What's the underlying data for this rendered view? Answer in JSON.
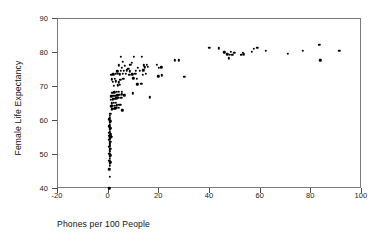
{
  "chart_data": {
    "type": "scatter",
    "title": "",
    "xlabel": "Phones per 100 People",
    "ylabel": "Female Life Expectancy",
    "xlim": [
      -20,
      100
    ],
    "ylim": [
      40,
      90
    ],
    "xticks": [
      -20,
      0,
      20,
      40,
      60,
      80,
      100
    ],
    "yticks": [
      40,
      50,
      60,
      70,
      80,
      90
    ],
    "xtick_labels": [
      "-20",
      "0",
      "20",
      "40",
      "60",
      "80",
      "100"
    ],
    "ytick_labels": [
      "40",
      "50",
      "60",
      "70",
      "80",
      "90"
    ],
    "grid": false,
    "legend": false,
    "marker": {
      "shape": "circle",
      "color": "#000000",
      "size": 2.4
    },
    "points": [
      [
        0.3,
        40.2
      ],
      [
        0.4,
        43.5
      ],
      [
        0.3,
        45.8
      ],
      [
        0.5,
        46.9
      ],
      [
        0.4,
        47.4
      ],
      [
        0.6,
        47.8
      ],
      [
        0.3,
        48.3
      ],
      [
        0.5,
        48.8
      ],
      [
        0.4,
        49.4
      ],
      [
        0.6,
        49.9
      ],
      [
        0.3,
        50.4
      ],
      [
        0.5,
        50.9
      ],
      [
        0.4,
        51.4
      ],
      [
        0.6,
        51.9
      ],
      [
        0.3,
        52.4
      ],
      [
        0.5,
        52.9
      ],
      [
        0.4,
        53.4
      ],
      [
        0.6,
        53.9
      ],
      [
        0.3,
        54.4
      ],
      [
        0.5,
        54.8
      ],
      [
        0.4,
        55.1
      ],
      [
        0.7,
        55.2
      ],
      [
        1.1,
        55.3
      ],
      [
        0.3,
        55.6
      ],
      [
        0.6,
        55.7
      ],
      [
        0.4,
        56.0
      ],
      [
        0.9,
        56.1
      ],
      [
        0.3,
        56.5
      ],
      [
        0.5,
        56.9
      ],
      [
        0.4,
        57.4
      ],
      [
        0.6,
        57.9
      ],
      [
        0.3,
        58.4
      ],
      [
        0.5,
        58.9
      ],
      [
        0.4,
        59.4
      ],
      [
        0.6,
        59.9
      ],
      [
        0.3,
        60.5
      ],
      [
        0.5,
        61.0
      ],
      [
        0.4,
        61.6
      ],
      [
        0.6,
        62.2
      ],
      [
        1.2,
        63.4
      ],
      [
        1.9,
        63.6
      ],
      [
        2.6,
        63.7
      ],
      [
        3.3,
        63.8
      ],
      [
        4.1,
        63.9
      ],
      [
        5.4,
        63.2
      ],
      [
        1.0,
        64.3
      ],
      [
        1.7,
        64.4
      ],
      [
        2.4,
        64.5
      ],
      [
        3.1,
        64.6
      ],
      [
        3.9,
        64.7
      ],
      [
        4.6,
        64.8
      ],
      [
        1.3,
        65.2
      ],
      [
        2.1,
        65.3
      ],
      [
        2.9,
        65.4
      ],
      [
        0.9,
        66.3
      ],
      [
        1.6,
        66.4
      ],
      [
        2.3,
        66.6
      ],
      [
        3.0,
        66.7
      ],
      [
        3.8,
        66.8
      ],
      [
        5.0,
        66.9
      ],
      [
        1.1,
        67.3
      ],
      [
        1.8,
        67.4
      ],
      [
        2.6,
        67.5
      ],
      [
        3.4,
        67.6
      ],
      [
        4.2,
        67.7
      ],
      [
        5.1,
        67.8
      ],
      [
        6.2,
        67.6
      ],
      [
        16.2,
        67.0
      ],
      [
        1.4,
        68.3
      ],
      [
        2.2,
        68.4
      ],
      [
        3.1,
        68.5
      ],
      [
        4.0,
        68.6
      ],
      [
        5.2,
        68.5
      ],
      [
        9.6,
        68.2
      ],
      [
        2.0,
        70.4
      ],
      [
        3.6,
        70.5
      ],
      [
        4.4,
        70.6
      ],
      [
        11.3,
        70.8
      ],
      [
        12.9,
        70.9
      ],
      [
        1.6,
        71.6
      ],
      [
        2.8,
        71.7
      ],
      [
        3.9,
        71.4
      ],
      [
        1.3,
        72.3
      ],
      [
        2.5,
        72.4
      ],
      [
        4.6,
        72.2
      ],
      [
        5.8,
        72.5
      ],
      [
        9.8,
        72.6
      ],
      [
        11.0,
        72.4
      ],
      [
        1.1,
        73.6
      ],
      [
        1.9,
        73.7
      ],
      [
        2.7,
        73.8
      ],
      [
        3.6,
        73.9
      ],
      [
        4.5,
        73.7
      ],
      [
        5.6,
        73.8
      ],
      [
        6.8,
        73.9
      ],
      [
        8.1,
        73.6
      ],
      [
        9.3,
        73.7
      ],
      [
        10.5,
        73.8
      ],
      [
        13.4,
        73.5
      ],
      [
        14.6,
        73.9
      ],
      [
        19.6,
        73.2
      ],
      [
        21.0,
        73.4
      ],
      [
        29.8,
        73.0
      ],
      [
        3.4,
        74.6
      ],
      [
        4.8,
        74.7
      ],
      [
        6.0,
        74.8
      ],
      [
        7.2,
        74.9
      ],
      [
        8.4,
        74.6
      ],
      [
        10.8,
        74.7
      ],
      [
        12.2,
        74.8
      ],
      [
        13.6,
        74.9
      ],
      [
        5.2,
        75.6
      ],
      [
        7.8,
        75.4
      ],
      [
        11.4,
        75.6
      ],
      [
        14.2,
        75.8
      ],
      [
        15.4,
        75.9
      ],
      [
        19.8,
        75.7
      ],
      [
        20.8,
        75.8
      ],
      [
        4.0,
        76.4
      ],
      [
        6.4,
        76.2
      ],
      [
        8.6,
        76.5
      ],
      [
        13.8,
        76.4
      ],
      [
        15.0,
        76.6
      ],
      [
        19.0,
        76.5
      ],
      [
        5.6,
        77.4
      ],
      [
        9.2,
        77.2
      ],
      [
        26.2,
        77.8
      ],
      [
        27.6,
        77.8
      ],
      [
        4.8,
        78.9
      ],
      [
        10.0,
        78.8
      ],
      [
        13.2,
        78.9
      ],
      [
        83.6,
        77.8
      ],
      [
        46.8,
        79.6
      ],
      [
        47.8,
        79.4
      ],
      [
        48.8,
        79.5
      ],
      [
        52.4,
        79.4
      ],
      [
        53.4,
        79.6
      ],
      [
        70.8,
        79.8
      ],
      [
        47.4,
        78.4
      ],
      [
        45.6,
        80.2
      ],
      [
        48.2,
        80.3
      ],
      [
        49.6,
        80.1
      ],
      [
        53.0,
        80.1
      ],
      [
        56.4,
        80.4
      ],
      [
        62.0,
        80.6
      ],
      [
        76.6,
        80.7
      ],
      [
        91.0,
        80.6
      ],
      [
        39.8,
        81.5
      ],
      [
        43.4,
        81.4
      ],
      [
        57.2,
        81.3
      ],
      [
        58.6,
        81.6
      ],
      [
        83.2,
        82.4
      ]
    ]
  }
}
